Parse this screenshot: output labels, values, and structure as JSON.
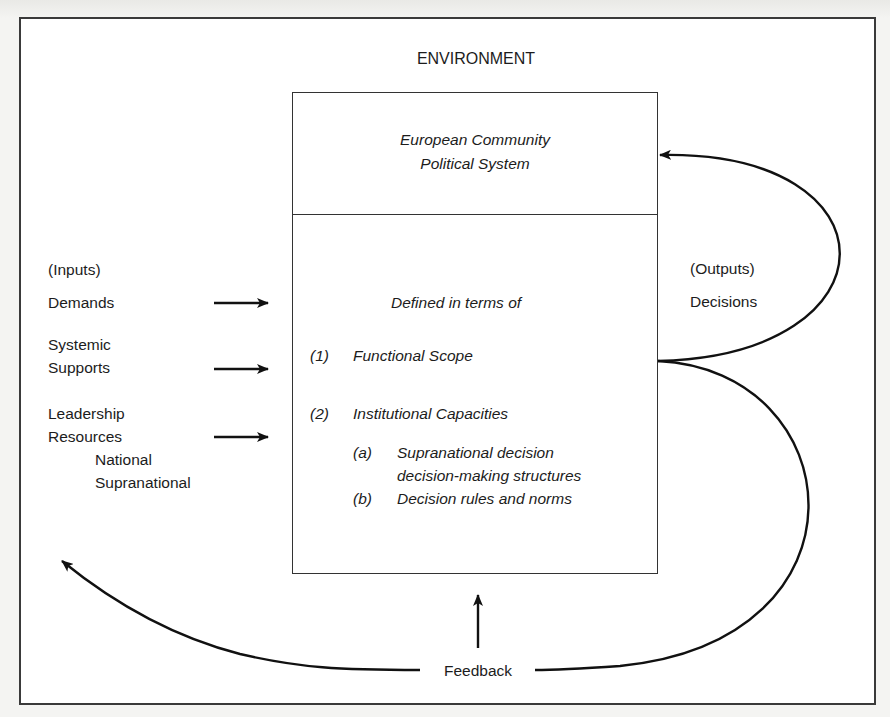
{
  "diagram": {
    "title": "ENVIRONMENT",
    "system": {
      "title_lines": [
        "European Community",
        "Political System"
      ],
      "defined_label": "Defined in terms of",
      "items": [
        {
          "num": "(1)",
          "label": "Functional Scope"
        },
        {
          "num": "(2)",
          "label": "Institutional Capacities"
        }
      ],
      "subitems": [
        {
          "num": "(a)",
          "lines": [
            "Supranational decision",
            "decision-making structures"
          ]
        },
        {
          "num": "(b)",
          "lines": [
            "Decision rules and norms"
          ]
        }
      ]
    },
    "inputs": {
      "heading": "(Inputs)",
      "demands": "Demands",
      "supports": [
        "Systemic",
        "Supports"
      ],
      "leadership": [
        "Leadership",
        "Resources"
      ],
      "leadership_sub": [
        "National",
        "Supranational"
      ]
    },
    "outputs": {
      "heading": "(Outputs)",
      "decisions": "Decisions"
    },
    "feedback": "Feedback",
    "colors": {
      "line": "#111111",
      "frame": "#3a3a3a",
      "background": "#ffffff"
    }
  }
}
